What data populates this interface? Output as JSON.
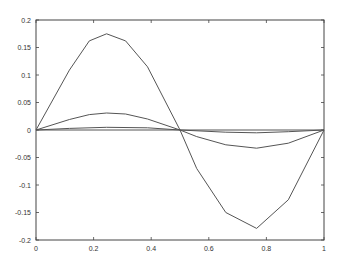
{
  "chart_data": {
    "type": "line",
    "title": "",
    "xlabel": "",
    "ylabel": "",
    "xlim": [
      0,
      1
    ],
    "ylim": [
      -0.2,
      0.2
    ],
    "grid": false,
    "legend": null,
    "x_ticks": [
      0,
      0.2,
      0.4,
      0.6,
      0.8,
      1
    ],
    "x_tick_labels": [
      "0",
      "0.2",
      "0.4",
      "0.6",
      "0.8",
      "1"
    ],
    "y_ticks": [
      0.2,
      0.15,
      0.1,
      0.05,
      0,
      -0.05,
      -0.1,
      -0.15,
      -0.2
    ],
    "y_tick_labels": [
      "0.2",
      "0.15",
      "0.1",
      "0.05",
      "0",
      "-0.05",
      "-0.1",
      "-0.15",
      "-0.2"
    ],
    "series": [
      {
        "name": "series-1",
        "x": [
          0,
          0.116,
          0.185,
          0.245,
          0.311,
          0.387,
          0.5,
          0.558,
          0.659,
          0.766,
          0.876,
          1.0
        ],
        "y": [
          0,
          0.109,
          0.162,
          0.175,
          0.162,
          0.115,
          0.0,
          -0.07,
          -0.15,
          -0.179,
          -0.127,
          0
        ]
      },
      {
        "name": "series-2",
        "x": [
          0,
          0.116,
          0.185,
          0.245,
          0.311,
          0.387,
          0.5,
          0.558,
          0.659,
          0.766,
          0.876,
          1.0
        ],
        "y": [
          0,
          0.019,
          0.028,
          0.031,
          0.029,
          0.02,
          0.0,
          -0.012,
          -0.027,
          -0.033,
          -0.024,
          0
        ]
      },
      {
        "name": "series-3",
        "x": [
          0,
          0.116,
          0.245,
          0.387,
          0.5,
          0.659,
          0.766,
          0.876,
          1.0
        ],
        "y": [
          0,
          0.003,
          0.005,
          0.004,
          0.0,
          -0.004,
          -0.005,
          -0.003,
          0
        ]
      },
      {
        "name": "series-4",
        "x": [
          0,
          0.5,
          1.0
        ],
        "y": [
          0,
          0,
          0
        ]
      }
    ]
  },
  "colors": {
    "axis": "#444444",
    "line": "#555555",
    "background": "#ffffff"
  }
}
